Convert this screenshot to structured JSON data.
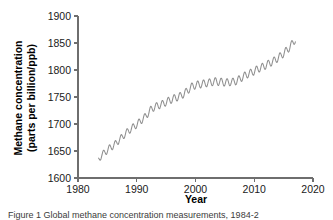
{
  "figure": {
    "caption": "Figure 1 Global methane concentration measurements, 1984-2",
    "line_color": "#8f8f8f",
    "axis_color": "#6e6e6e",
    "background": "#ffffff"
  },
  "chart_data": {
    "type": "line",
    "title": "",
    "xlabel": "Year",
    "ylabel": "Methane concentration (parts per billion/ppb)",
    "ylabel_line1": "Methane concentration",
    "ylabel_line2": "(parts per billion/ppb)",
    "xlim": [
      1980,
      2020
    ],
    "ylim": [
      1600,
      1900
    ],
    "xticks": [
      1980,
      1990,
      2000,
      2010,
      2020
    ],
    "xtick_labels": [
      "1980",
      "1990",
      "2000",
      "2010",
      "2020"
    ],
    "yticks": [
      1600,
      1650,
      1700,
      1750,
      1800,
      1850,
      1900
    ],
    "ytick_labels": [
      "1600",
      "1650",
      "1700",
      "1750",
      "1800",
      "1850",
      "1900"
    ],
    "grid": false,
    "legend": "none",
    "series": [
      {
        "name": "Global mean methane concentration",
        "seasonal_amplitude_ppb": 7,
        "x": [
          1983.5,
          1984.0,
          1984.5,
          1985.0,
          1985.5,
          1986.0,
          1986.5,
          1987.0,
          1987.5,
          1988.0,
          1988.5,
          1989.0,
          1989.5,
          1990.0,
          1990.5,
          1991.0,
          1991.5,
          1992.0,
          1992.5,
          1993.0,
          1993.5,
          1994.0,
          1994.5,
          1995.0,
          1995.5,
          1996.0,
          1996.5,
          1997.0,
          1997.5,
          1998.0,
          1998.5,
          1999.0,
          1999.5,
          2000.0,
          2000.5,
          2001.0,
          2001.5,
          2002.0,
          2002.5,
          2003.0,
          2003.5,
          2004.0,
          2004.5,
          2005.0,
          2005.5,
          2006.0,
          2006.5,
          2007.0,
          2007.5,
          2008.0,
          2008.5,
          2009.0,
          2009.5,
          2010.0,
          2010.5,
          2011.0,
          2011.5,
          2012.0,
          2012.5,
          2013.0,
          2013.5,
          2014.0,
          2014.5,
          2015.0,
          2015.5,
          2016.0,
          2016.5,
          2017.0
        ],
        "values": [
          1632,
          1644,
          1645,
          1653,
          1655,
          1661,
          1663,
          1672,
          1674,
          1683,
          1685,
          1692,
          1694,
          1700,
          1703,
          1710,
          1713,
          1722,
          1727,
          1732,
          1733,
          1736,
          1737,
          1741,
          1743,
          1746,
          1748,
          1750,
          1752,
          1756,
          1760,
          1766,
          1770,
          1772,
          1773,
          1774,
          1775,
          1776,
          1777,
          1778,
          1779,
          1778,
          1778,
          1777,
          1777,
          1778,
          1778,
          1780,
          1783,
          1787,
          1790,
          1793,
          1795,
          1798,
          1801,
          1804,
          1806,
          1809,
          1812,
          1815,
          1818,
          1822,
          1826,
          1831,
          1836,
          1842,
          1849,
          1857
        ]
      }
    ],
    "annotations": [
      {
        "label": "steady rise",
        "period": "1984-1992"
      },
      {
        "label": "slowdown plateau",
        "period": "1999-2006",
        "value_ppb": 1778
      },
      {
        "label": "renewed rise",
        "period": "2007-2017"
      }
    ]
  }
}
